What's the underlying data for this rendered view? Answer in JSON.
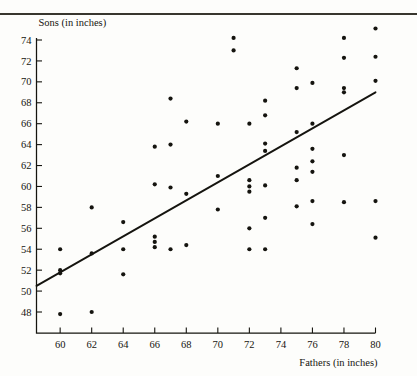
{
  "figure": {
    "top_rule": true,
    "faint_header_remnant": "",
    "background_color": "#fdfdfb",
    "ink_color": "#15140f"
  },
  "chart_data": {
    "type": "scatter",
    "title": "",
    "xlabel": "Fathers (in inches)",
    "ylabel": "Sons (in inches)",
    "xlim": [
      58.5,
      81.0
    ],
    "ylim": [
      46.8,
      75.6
    ],
    "xticks": [
      60,
      62,
      64,
      66,
      68,
      70,
      72,
      74,
      76,
      78,
      80
    ],
    "yticks": [
      48,
      50,
      52,
      54,
      56,
      58,
      60,
      62,
      64,
      66,
      68,
      70,
      72,
      74
    ],
    "grid": false,
    "legend": null,
    "marker": "filled-circle",
    "marker_size": 2.1,
    "points": [
      [
        60,
        54.0
      ],
      [
        60,
        52.0
      ],
      [
        60,
        51.7
      ],
      [
        60,
        47.8
      ],
      [
        62,
        58.0
      ],
      [
        62,
        53.6
      ],
      [
        62,
        48.0
      ],
      [
        64,
        56.6
      ],
      [
        64,
        54.0
      ],
      [
        64,
        51.6
      ],
      [
        66,
        63.8
      ],
      [
        66,
        60.2
      ],
      [
        66,
        55.2
      ],
      [
        66,
        54.7
      ],
      [
        66,
        54.2
      ],
      [
        67,
        68.4
      ],
      [
        67,
        64.0
      ],
      [
        67,
        59.9
      ],
      [
        67,
        54.0
      ],
      [
        68,
        66.2
      ],
      [
        68,
        59.3
      ],
      [
        68,
        54.4
      ],
      [
        70,
        66.0
      ],
      [
        70,
        61.0
      ],
      [
        70,
        57.8
      ],
      [
        71,
        74.2
      ],
      [
        71,
        73.0
      ],
      [
        72,
        66.0
      ],
      [
        72,
        60.6
      ],
      [
        72,
        60.0
      ],
      [
        72,
        59.5
      ],
      [
        72,
        56.0
      ],
      [
        72,
        54.0
      ],
      [
        73,
        68.2
      ],
      [
        73,
        66.8
      ],
      [
        73,
        64.1
      ],
      [
        73,
        63.4
      ],
      [
        73,
        60.1
      ],
      [
        73,
        57.0
      ],
      [
        73,
        54.0
      ],
      [
        75,
        71.3
      ],
      [
        75,
        69.4
      ],
      [
        75,
        65.2
      ],
      [
        75,
        61.8
      ],
      [
        75,
        60.6
      ],
      [
        75,
        58.1
      ],
      [
        76,
        69.9
      ],
      [
        76,
        66.0
      ],
      [
        76,
        63.6
      ],
      [
        76,
        62.4
      ],
      [
        76,
        61.4
      ],
      [
        76,
        58.6
      ],
      [
        76,
        56.4
      ],
      [
        78,
        74.2
      ],
      [
        78,
        72.3
      ],
      [
        78,
        69.4
      ],
      [
        78,
        69.0
      ],
      [
        78,
        63.0
      ],
      [
        78,
        58.5
      ],
      [
        80,
        75.1
      ],
      [
        80,
        72.4
      ],
      [
        80,
        70.1
      ],
      [
        80,
        58.6
      ],
      [
        80,
        55.1
      ]
    ],
    "fit_line": {
      "kind": "regression-line",
      "x_start": 58.5,
      "y_start": 50.5,
      "x_end": 80.0,
      "y_end": 69.0
    }
  }
}
